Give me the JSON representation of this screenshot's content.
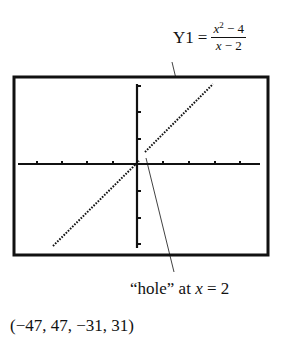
{
  "function_label": {
    "name": "Y1",
    "equals": "=",
    "numerator_base": "x",
    "numerator_exponent": "2",
    "numerator_rest": " − 4",
    "denominator_var": "x",
    "denominator_rest": " − 2"
  },
  "hole_annotation": {
    "quote_text": "“hole” at ",
    "var": "x",
    "rest": " = 2"
  },
  "window_label": "(−47, 47, −31, 31)",
  "calculator_screen": {
    "window": {
      "xmin": -47,
      "xmax": 47,
      "ymin": -31,
      "ymax": 31
    },
    "x_ticks_left": 4,
    "x_ticks_right": 4,
    "y_ticks_up": 3,
    "y_ticks_down": 3,
    "graph": "y = x + 2 with a hole at (2, 4)",
    "colors": {
      "ink": "#111111",
      "background": "#ffffff"
    }
  }
}
